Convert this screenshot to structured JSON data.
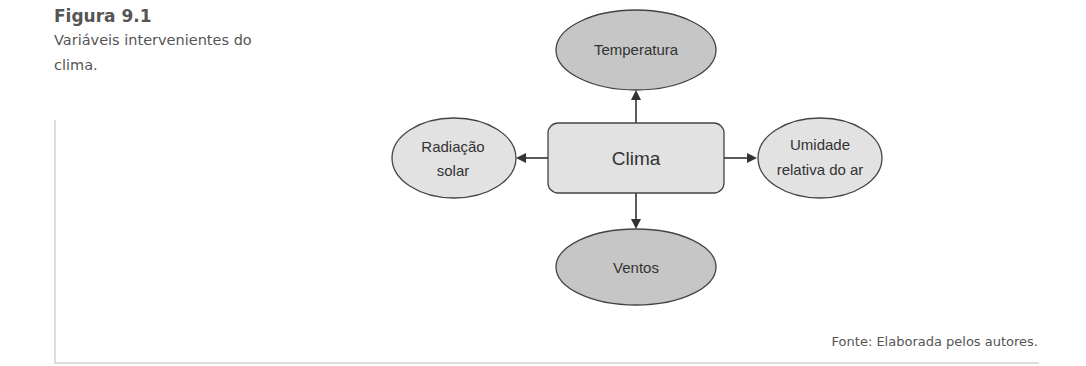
{
  "caption": {
    "title": "Figura 9.1",
    "text": "Variáveis intervenientes do clima."
  },
  "diagram": {
    "center": {
      "label": "Clima",
      "fill": "#e2e2e2"
    },
    "nodes": [
      {
        "id": "top",
        "label_lines": [
          "Temperatura"
        ],
        "fill": "#c6c6c6"
      },
      {
        "id": "left",
        "label_lines": [
          "Radiação",
          "solar"
        ],
        "fill": "#e2e2e2"
      },
      {
        "id": "right",
        "label_lines": [
          "Umidade",
          "relativa do ar"
        ],
        "fill": "#e2e2e2"
      },
      {
        "id": "bottom",
        "label_lines": [
          "Ventos"
        ],
        "fill": "#c6c6c6"
      }
    ],
    "stroke_color": "#444444"
  },
  "source": "Fonte: Elaborada pelos autores."
}
